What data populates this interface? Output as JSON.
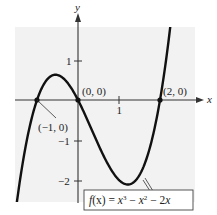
{
  "chart_data": {
    "type": "line",
    "title": "",
    "function_label": "f(x) = x^3 - x^2 - 2x",
    "xlabel": "x",
    "ylabel": "y",
    "xlim": [
      -1.5,
      2.3
    ],
    "ylim": [
      -2.6,
      1.8
    ],
    "grid": false,
    "x_ticks": [
      {
        "value": 1,
        "label": "1"
      }
    ],
    "y_ticks": [
      {
        "value": 1,
        "label": "1"
      },
      {
        "value": -1,
        "label": "−1"
      },
      {
        "value": -2,
        "label": "−2"
      }
    ],
    "series": [
      {
        "name": "f(x) = x^3 - x^2 - 2x",
        "x": [
          -1.5,
          -1.0,
          -0.5,
          0.0,
          0.5,
          1.0,
          1.5,
          2.0,
          2.3
        ],
        "y": [
          -2.625,
          0.0,
          0.625,
          0.0,
          -1.125,
          -2.0,
          -1.875,
          0.0,
          2.277
        ]
      }
    ],
    "annotations": [
      {
        "text": "(−1, 0)",
        "x": -1,
        "y": 0
      },
      {
        "text": "(0, 0)",
        "x": 0,
        "y": 0
      },
      {
        "text": "(2, 0)",
        "x": 2,
        "y": 0
      }
    ]
  },
  "labels": {
    "x_axis": "x",
    "y_axis": "y",
    "tick_x1": "1",
    "tick_y1": "1",
    "tick_ym1": "−1",
    "tick_ym2": "−2",
    "pt_m1": "(−1, 0)",
    "pt_0": "(0, 0)",
    "pt_2": "(2, 0)",
    "fn_f": "f",
    "fn_mid": "(x) = ",
    "fn_x3": "x",
    "fn_sup3": "3",
    "fn_minus1": " − ",
    "fn_x2": "x",
    "fn_sup2": "2",
    "fn_minus2": " − 2",
    "fn_x": "x"
  },
  "colors": {
    "background_panel": "#f2f2f2",
    "curve": "#111111",
    "axis": "#333333"
  }
}
